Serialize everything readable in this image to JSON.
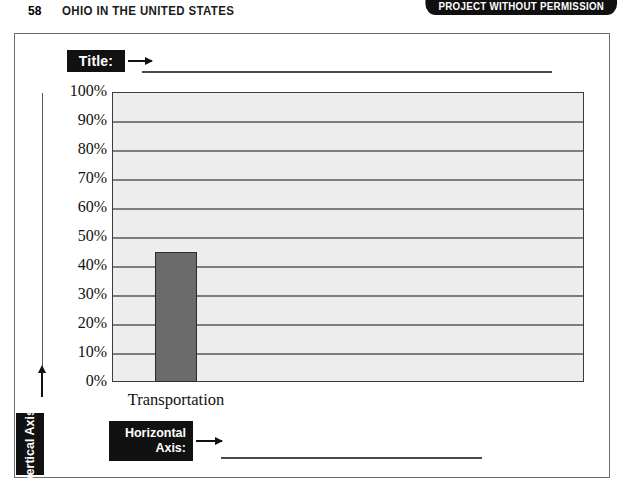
{
  "header": {
    "page_number": "58",
    "title": "OHIO IN THE UNITED STATES",
    "permission_badge": "PROJECT WITHOUT PERMISSION"
  },
  "callouts": {
    "title_label": "Title:",
    "horizontal_axis_label_line1": "Horizontal",
    "horizontal_axis_label_line2": "Axis:",
    "vertical_axis_label": "Vertical Axis:"
  },
  "chart_data": {
    "type": "bar",
    "title": "",
    "xlabel": "",
    "ylabel": "",
    "categories": [
      "Transportation"
    ],
    "values": [
      45
    ],
    "ylim": [
      0,
      100
    ],
    "yticks": [
      "0%",
      "10%",
      "20%",
      "30%",
      "40%",
      "50%",
      "60%",
      "70%",
      "80%",
      "90%",
      "100%"
    ],
    "ytick_values": [
      0,
      10,
      20,
      30,
      40,
      50,
      60,
      70,
      80,
      90,
      100
    ],
    "grid": true,
    "legend": "none",
    "bar_color": "#6b6b6b",
    "plot_background": "#ededed",
    "gridline_color": "#7d7d7d"
  }
}
